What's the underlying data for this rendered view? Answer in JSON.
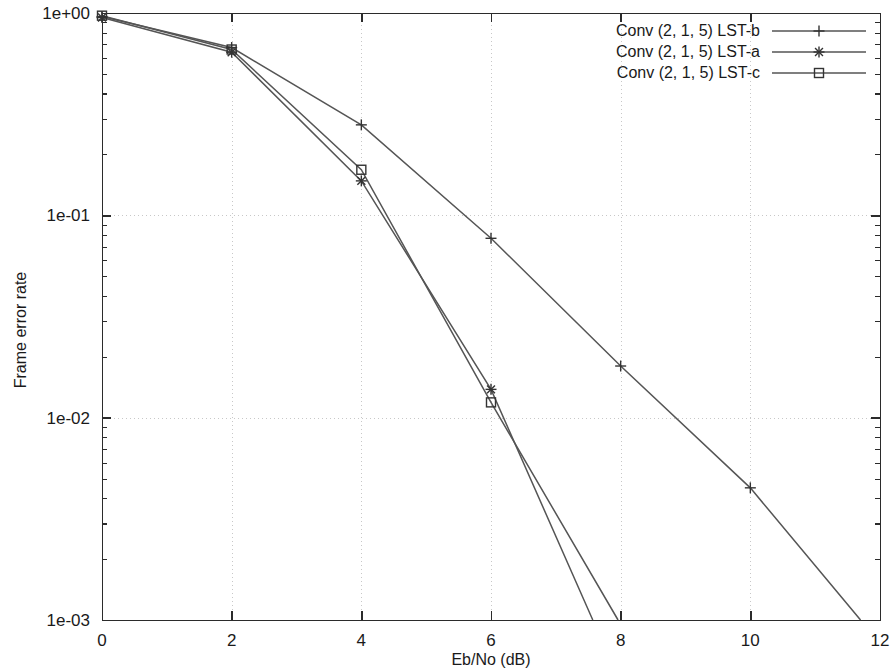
{
  "chart_data": {
    "type": "line",
    "title": "",
    "subtitle": "",
    "xlabel": "Eb/No (dB)",
    "ylabel": "Frame error rate",
    "xlim": [
      0,
      12
    ],
    "ylim": [
      0.001,
      1
    ],
    "yscale": "log",
    "xscale": "linear",
    "grid": true,
    "legend_position": "top-right",
    "xticks": [
      0,
      2,
      4,
      6,
      8,
      10,
      12
    ],
    "xtick_labels": [
      "0",
      "2",
      "4",
      "6",
      "8",
      "10",
      "12"
    ],
    "yticks": [
      1,
      0.1,
      0.01,
      0.001
    ],
    "ytick_labels": [
      "1e+00",
      "1e-01",
      "1e-02",
      "1e-03"
    ],
    "x": [
      0,
      2,
      4,
      6,
      8,
      10
    ],
    "series": [
      {
        "name": "Conv (2, 1, 5) LST-b",
        "marker": "plus",
        "x": [
          0,
          2,
          4,
          6,
          8,
          10,
          11.7
        ],
        "values": [
          0.96,
          0.675,
          0.28,
          0.077,
          0.018,
          0.0045,
          0.001
        ]
      },
      {
        "name": "Conv (2, 1, 5) LST-a",
        "marker": "asterisk",
        "x": [
          0,
          2,
          4,
          6,
          7.57
        ],
        "values": [
          0.95,
          0.64,
          0.148,
          0.0138,
          0.001
        ]
      },
      {
        "name": "Conv (2, 1, 5) LST-c",
        "marker": "square",
        "x": [
          0,
          2,
          4,
          6,
          7.96
        ],
        "values": [
          0.97,
          0.66,
          0.168,
          0.0119,
          0.001
        ]
      }
    ]
  },
  "legend": {
    "entries": [
      {
        "label": "Conv (2, 1, 5) LST-b",
        "marker": "plus"
      },
      {
        "label": "Conv (2, 1, 5) LST-a",
        "marker": "asterisk"
      },
      {
        "label": "Conv (2, 1, 5) LST-c",
        "marker": "square"
      }
    ]
  },
  "colors": {
    "line": "#555555",
    "marker": "#333333",
    "grid": "#c8c8c8",
    "frame": "#2b2b2b",
    "text": "#1a1a1a",
    "background": "#ffffff"
  }
}
